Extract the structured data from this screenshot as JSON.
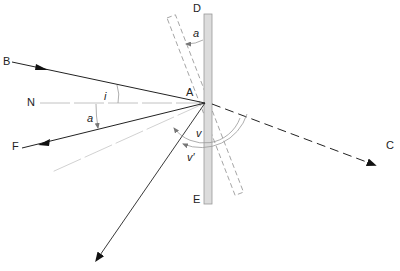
{
  "diagram": {
    "type": "optics-rotating-mirror-reflection",
    "labels": {
      "point_A": "A",
      "point_B": "B",
      "point_C": "C",
      "point_D": "D",
      "point_E": "E",
      "point_F": "F",
      "point_N": "N",
      "angle_i": "i",
      "angle_a_top": "a",
      "angle_a_left": "a",
      "angle_v": "v",
      "angle_v_prime": "v′"
    },
    "colors": {
      "ray": "#222222",
      "mirror_fill": "#d9d9d9",
      "mirror_stroke": "#888888",
      "guide": "#aaaaaa"
    }
  }
}
